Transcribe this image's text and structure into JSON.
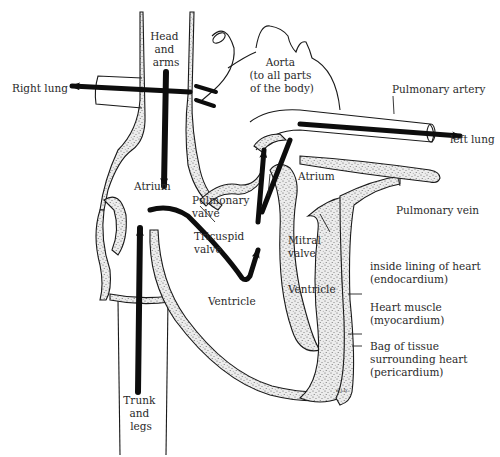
{
  "diagram": {
    "colors": {
      "ink": "#1a1a1a",
      "tissue_fill": "#e9e9e9",
      "background": "#ffffff"
    },
    "labels": {
      "head_arms": [
        "Head",
        "and",
        "arms"
      ],
      "right_lung": "Right lung",
      "aorta": [
        "Aorta",
        "(to all parts",
        "of the body)"
      ],
      "pulmonary_artery": "Pulmonary artery",
      "left_lung": "left lung",
      "atrium_right": "Atrium",
      "atrium_left": "Atrium",
      "pulmonary_valve": [
        "Pulmonary",
        "valve"
      ],
      "tricuspid_valve": [
        "Tricuspid",
        "valve"
      ],
      "mitral_valve": [
        "Mitral",
        "valve"
      ],
      "pulmonary_vein": "Pulmonary vein",
      "ventricle_right": "Ventricle",
      "ventricle_left": "Ventricle",
      "endocardium": [
        "inside lining of heart",
        "(endocardium)"
      ],
      "myocardium": [
        "Heart muscle",
        "(myocardium)"
      ],
      "pericardium": [
        "Bag of tissue",
        "surrounding heart",
        "(pericardium)"
      ],
      "trunk_legs": [
        "Trunk",
        "and",
        "legs"
      ],
      "signature": "e.j.b."
    }
  }
}
